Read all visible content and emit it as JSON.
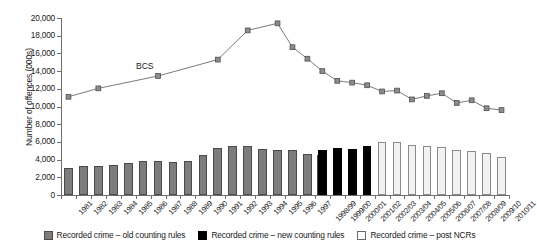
{
  "chart_data": {
    "type": "bar",
    "title": "",
    "subtitle": "",
    "xlabel": "",
    "ylabel": "Number of offences (000s)",
    "ylim": [
      0,
      20000
    ],
    "ytick_step": 2000,
    "ytick_labels": [
      "0",
      "2,000",
      "4,000",
      "6,000",
      "8,000",
      "10,000",
      "12,000",
      "14,000",
      "16,000",
      "18,000",
      "20,000"
    ],
    "ytick_values": [
      0,
      2000,
      4000,
      6000,
      8000,
      10000,
      12000,
      14000,
      16000,
      18000,
      20000
    ],
    "grid": false,
    "legend_position": "bottom",
    "categories": [
      "1981",
      "1982",
      "1983",
      "1984",
      "1985",
      "1986",
      "1987",
      "1988",
      "1989",
      "1990",
      "1991",
      "1992",
      "1993",
      "1994",
      "1995",
      "1996",
      "1997",
      "1998/99",
      "1999/00",
      "2000/01",
      "2001/02",
      "2002/03",
      "2003/04",
      "2004/05",
      "2005/06",
      "2006/07",
      "2007/08",
      "2008/09",
      "2009/10",
      "2010/11"
    ],
    "series": [
      {
        "name": "Recorded crime – old counting rules",
        "type": "bar",
        "color": "#7d7d7d",
        "values": [
          3000,
          3260,
          3250,
          3400,
          3610,
          3810,
          3890,
          3720,
          3870,
          4540,
          5280,
          5590,
          5530,
          5250,
          5100,
          5040,
          4600,
          4500,
          null,
          null,
          null,
          null,
          null,
          null,
          null,
          null,
          null,
          null,
          null,
          null
        ]
      },
      {
        "name": "Recorded crime – new counting rules",
        "type": "bar",
        "color": "#000000",
        "values": [
          null,
          null,
          null,
          null,
          null,
          null,
          null,
          null,
          null,
          null,
          null,
          null,
          null,
          null,
          null,
          null,
          null,
          5110,
          5300,
          5170,
          5530,
          null,
          null,
          null,
          null,
          null,
          null,
          null,
          null,
          null
        ]
      },
      {
        "name": "Recorded crime – post NCRs",
        "type": "bar",
        "color": "#f2f2f2",
        "values": [
          null,
          null,
          null,
          null,
          null,
          null,
          null,
          null,
          null,
          null,
          null,
          null,
          null,
          null,
          null,
          null,
          null,
          null,
          null,
          null,
          null,
          5970,
          6010,
          5640,
          5560,
          5430,
          5130,
          4950,
          4700,
          4340
        ]
      },
      {
        "name": "BCS",
        "type": "line",
        "color": "#6b6b6b",
        "marker": "square",
        "values": [
          11100,
          null,
          12050,
          null,
          null,
          null,
          13450,
          null,
          null,
          null,
          15300,
          null,
          18600,
          null,
          19400,
          16700,
          15400,
          14000,
          12900,
          12700,
          12400,
          11700,
          11800,
          10800,
          11200,
          11500,
          10400,
          10700,
          9800,
          9600
        ]
      }
    ],
    "annotations": [
      {
        "text": "BCS",
        "x_category": "1987",
        "y_value": 14450
      }
    ],
    "legend": [
      {
        "label": "Recorded crime – old counting rules",
        "swatch": "old"
      },
      {
        "label": "Recorded crime – new counting rules",
        "swatch": "new"
      },
      {
        "label": "Recorded crime – post NCRs",
        "swatch": "post"
      }
    ]
  }
}
